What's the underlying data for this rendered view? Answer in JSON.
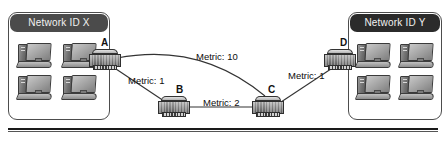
{
  "diagram": {
    "type": "network-topology"
  },
  "networks": [
    {
      "id": "x",
      "label": "Network ID X",
      "hosts": [
        "workstation",
        "workstation",
        "workstation",
        "workstation"
      ]
    },
    {
      "id": "y",
      "label": "Network ID Y",
      "hosts": [
        "workstation",
        "workstation",
        "workstation",
        "workstation"
      ]
    }
  ],
  "routers": [
    {
      "id": "a",
      "label": "A"
    },
    {
      "id": "b",
      "label": "B"
    },
    {
      "id": "c",
      "label": "C"
    },
    {
      "id": "d",
      "label": "D"
    }
  ],
  "links": [
    {
      "id": "a-c",
      "from": "A",
      "to": "C",
      "label": "Metric: 10",
      "metric": 10
    },
    {
      "id": "a-b",
      "from": "A",
      "to": "B",
      "label": "Metric: 1",
      "metric": 1
    },
    {
      "id": "b-c",
      "from": "B",
      "to": "C",
      "label": "Metric: 2",
      "metric": 2
    },
    {
      "id": "c-d",
      "from": "C",
      "to": "D",
      "label": "Metric: 1",
      "metric": 1
    }
  ],
  "colors": {
    "header_light": "#4b4b4b",
    "header_dark": "#2b2b2b",
    "box_border": "#4d4d4d",
    "link_line": "#333333",
    "text": "#0d0d0d",
    "rule": "#1a1a1a"
  }
}
